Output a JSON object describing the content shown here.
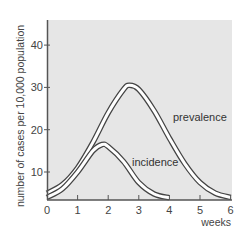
{
  "chart_data": {
    "type": "line",
    "title": "",
    "xlabel": "weeks",
    "ylabel": "number of cases per 10,000 population",
    "x_ticks": [
      "0",
      "1",
      "2",
      "3",
      "4",
      "5",
      "6"
    ],
    "y_ticks": [
      "10",
      "20",
      "30",
      "40"
    ],
    "xlim": [
      0,
      6
    ],
    "ylim": [
      3.5,
      45
    ],
    "grid": false,
    "legend": "inline labels",
    "series": [
      {
        "name": "prevalence",
        "x": [
          0,
          0.5,
          1,
          1.5,
          2,
          2.5,
          2.7,
          3,
          3.5,
          4,
          4.5,
          5,
          5.5,
          6
        ],
        "values": [
          5,
          7,
          11,
          17,
          24,
          29.5,
          30.5,
          29.5,
          24.5,
          18,
          12,
          7.5,
          5,
          4
        ]
      },
      {
        "name": "incidence",
        "x": [
          0,
          0.5,
          1,
          1.5,
          1.8,
          2,
          2.5,
          3,
          3.5,
          4
        ],
        "values": [
          4,
          6,
          10,
          15,
          16.5,
          16,
          12.5,
          7.5,
          4.8,
          3.9
        ]
      }
    ]
  },
  "labels": {
    "prevalence": "prevalence",
    "incidence": "incidence",
    "xlabel": "weeks",
    "ylabel": "number of cases per 10,000 population",
    "x_ticks": [
      "0",
      "1",
      "2",
      "3",
      "4",
      "5",
      "6"
    ],
    "y_ticks": [
      "10",
      "20",
      "30",
      "40"
    ]
  },
  "colors": {
    "plot_background": "#e6e6e6",
    "axis": "#555555",
    "curve_outline": "#444444",
    "curve_fill": "#ffffff"
  }
}
